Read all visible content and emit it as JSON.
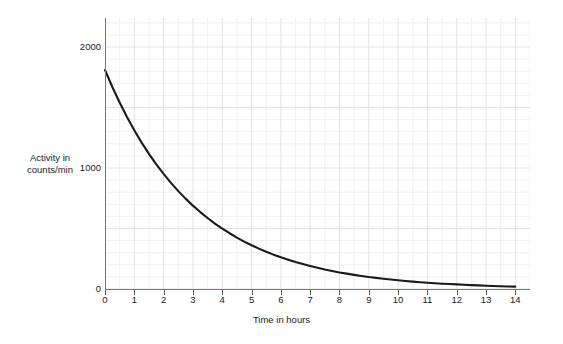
{
  "chart_data": {
    "type": "line",
    "title": "",
    "xlabel": "Time in hours",
    "ylabel_line1": "Activity in",
    "ylabel_line2": "counts/min",
    "ylabel": "Activity in counts/min",
    "xlim": [
      0,
      14.5
    ],
    "ylim": [
      0,
      2240
    ],
    "grid": true,
    "minor_grid": true,
    "legend": "none",
    "series_name": "Radioactive decay",
    "line_color": "#1a1a1a",
    "grid_color": "#e3e3e3",
    "minor_grid_color": "#f0f0f0",
    "axis_color": "#777777",
    "background": "#ffffff",
    "xticks": [
      0,
      1,
      2,
      3,
      4,
      5,
      6,
      7,
      8,
      9,
      10,
      11,
      12,
      13,
      14
    ],
    "xtick_labels": [
      "0",
      "1",
      "2",
      "3",
      "4",
      "5",
      "6",
      "7",
      "8",
      "9",
      "10",
      "11",
      "12",
      "13",
      "14"
    ],
    "yticks": [
      0,
      1000,
      2000
    ],
    "ytick_labels": [
      "0",
      "1000",
      "2000"
    ],
    "initial_activity": 1810,
    "half_life_hours": 2.2,
    "x": [
      0,
      0.25,
      0.5,
      0.75,
      1,
      1.25,
      1.5,
      1.75,
      2,
      2.25,
      2.5,
      2.75,
      3,
      3.25,
      3.5,
      3.75,
      4,
      4.25,
      4.5,
      4.75,
      5,
      5.25,
      5.5,
      5.75,
      6,
      6.25,
      6.5,
      6.75,
      7,
      7.25,
      7.5,
      7.75,
      8,
      8.25,
      8.5,
      8.75,
      9,
      9.25,
      9.5,
      9.75,
      10,
      10.25,
      10.5,
      10.75,
      11,
      11.25,
      11.5,
      11.75,
      12,
      12.25,
      12.5,
      12.75,
      13,
      13.25,
      13.5,
      13.75,
      14
    ],
    "y": [
      1810,
      1670,
      1541,
      1422,
      1312,
      1210,
      1117,
      1030,
      951,
      877,
      809,
      747,
      689,
      636,
      587,
      541,
      500,
      461,
      425,
      392,
      362,
      334,
      308,
      284,
      262,
      242,
      223,
      206,
      190,
      175,
      161,
      149,
      137,
      127,
      117,
      108,
      99,
      92,
      85,
      78,
      72,
      66,
      61,
      56,
      52,
      48,
      44,
      41,
      38,
      35,
      32,
      30,
      27,
      25,
      23,
      21,
      20
    ]
  },
  "axis": {
    "x_title": "Time in hours",
    "y_title_line1": "Activity in",
    "y_title_line2": "counts/min"
  }
}
